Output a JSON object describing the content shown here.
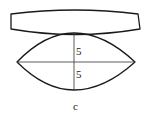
{
  "figure": {
    "caption": "c",
    "upper_shape": "concave-lens-profile",
    "lower_shape": "biconvex-lens-profile",
    "dimensions": {
      "upper_half": "5",
      "lower_half": "5"
    },
    "stroke_color": "#1a1a1a",
    "background_color": "#ffffff"
  }
}
